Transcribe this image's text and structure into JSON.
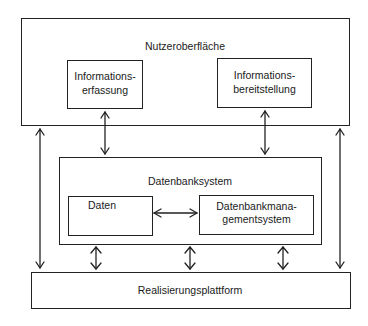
{
  "diagram": {
    "user_interface": {
      "title": "Nutzeroberfläche",
      "left_component": {
        "line1": "Informations-",
        "line2": "erfassung"
      },
      "right_component": {
        "line1": "Informations-",
        "line2": "bereitstellung"
      }
    },
    "database_system": {
      "title": "Datenbanksystem",
      "data_component": {
        "label": "Daten"
      },
      "dbms_component": {
        "line1": "Datenbankmana-",
        "line2": "gementsystem"
      }
    },
    "platform": {
      "title": "Realisierungsplattform"
    },
    "connections": [
      {
        "from": "Informationserfassung",
        "to": "Datenbanksystem",
        "type": "bidirectional"
      },
      {
        "from": "Informationsbereitstellung",
        "to": "Datenbanksystem",
        "type": "bidirectional"
      },
      {
        "from": "Daten",
        "to": "Datenbankmanagementsystem",
        "type": "bidirectional"
      },
      {
        "from": "Nutzeroberfläche (left)",
        "to": "Realisierungsplattform",
        "type": "bidirectional"
      },
      {
        "from": "Nutzeroberfläche (right)",
        "to": "Realisierungsplattform",
        "type": "bidirectional"
      },
      {
        "from": "Datenbanksystem (left)",
        "to": "Realisierungsplattform",
        "type": "bidirectional"
      },
      {
        "from": "Datenbanksystem (center)",
        "to": "Realisierungsplattform",
        "type": "bidirectional"
      },
      {
        "from": "Datenbanksystem (right)",
        "to": "Realisierungsplattform",
        "type": "bidirectional"
      }
    ]
  }
}
